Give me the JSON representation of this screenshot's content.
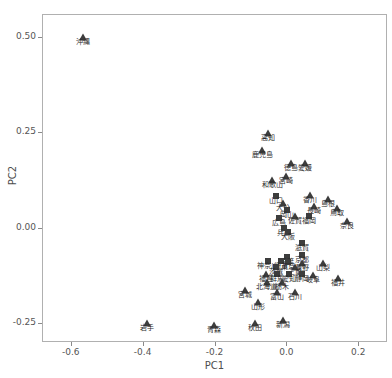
{
  "chart_data": {
    "type": "scatter",
    "title": "",
    "xlabel": "PC1",
    "ylabel": "PC2",
    "xlim": [
      -0.68,
      0.28
    ],
    "ylim": [
      -0.3,
      0.56
    ],
    "grid": false,
    "legend": "none",
    "xticks": [
      "-0.6",
      "-0.4",
      "-0.2",
      "0.0",
      "0.2"
    ],
    "xtick_values": [
      -0.6,
      -0.4,
      -0.2,
      0.0,
      0.2
    ],
    "yticks": [
      "0.50",
      "0.25",
      "0.00",
      "-0.25"
    ],
    "ytick_values": [
      0.5,
      0.25,
      0.0,
      -0.25
    ],
    "point_label_lang": "ja",
    "points": [
      {
        "label": "沖縄",
        "x": -0.57,
        "y": 0.502,
        "marker": "triangle"
      },
      {
        "label": "高知",
        "x": -0.055,
        "y": 0.25,
        "marker": "triangle"
      },
      {
        "label": "鹿児島",
        "x": -0.07,
        "y": 0.205,
        "marker": "triangle"
      },
      {
        "label": "徳島",
        "x": 0.01,
        "y": 0.172,
        "marker": "triangle"
      },
      {
        "label": "愛媛",
        "x": 0.048,
        "y": 0.172,
        "marker": "triangle"
      },
      {
        "label": "和歌山",
        "x": -0.042,
        "y": 0.128,
        "marker": "triangle"
      },
      {
        "label": "宮崎",
        "x": -0.005,
        "y": 0.138,
        "marker": "triangle"
      },
      {
        "label": "山口",
        "x": -0.032,
        "y": 0.085,
        "marker": "square"
      },
      {
        "label": "大分",
        "x": -0.012,
        "y": 0.068,
        "marker": "triangle"
      },
      {
        "label": "岡山",
        "x": 0.0,
        "y": 0.05,
        "marker": "square"
      },
      {
        "label": "香川",
        "x": 0.062,
        "y": 0.088,
        "marker": "triangle"
      },
      {
        "label": "長崎",
        "x": 0.075,
        "y": 0.058,
        "marker": "triangle"
      },
      {
        "label": "島根",
        "x": 0.112,
        "y": 0.078,
        "marker": "triangle"
      },
      {
        "label": "鳥取",
        "x": 0.138,
        "y": 0.055,
        "marker": "triangle"
      },
      {
        "label": "広島",
        "x": -0.022,
        "y": 0.028,
        "marker": "square"
      },
      {
        "label": "佐賀",
        "x": 0.022,
        "y": 0.032,
        "marker": "triangle"
      },
      {
        "label": "福岡",
        "x": 0.06,
        "y": 0.032,
        "marker": "square"
      },
      {
        "label": "奈良",
        "x": 0.165,
        "y": 0.02,
        "marker": "triangle"
      },
      {
        "label": "兵庫",
        "x": -0.01,
        "y": 0.002,
        "marker": "square"
      },
      {
        "label": "大阪",
        "x": 0.002,
        "y": -0.01,
        "marker": "square"
      },
      {
        "label": "滋賀",
        "x": 0.04,
        "y": -0.038,
        "marker": "square"
      },
      {
        "label": "千葉",
        "x": 0.0,
        "y": -0.075,
        "marker": "square"
      },
      {
        "label": "京都",
        "x": 0.04,
        "y": -0.068,
        "marker": "square"
      },
      {
        "label": "神奈川",
        "x": -0.055,
        "y": -0.085,
        "marker": "square"
      },
      {
        "label": "埼玉",
        "x": -0.018,
        "y": -0.085,
        "marker": "square"
      },
      {
        "label": "東京",
        "x": 0.002,
        "y": -0.088,
        "marker": "square"
      },
      {
        "label": "長野",
        "x": 0.04,
        "y": -0.09,
        "marker": "triangle"
      },
      {
        "label": "山梨",
        "x": 0.098,
        "y": -0.09,
        "marker": "triangle"
      },
      {
        "label": "茨城",
        "x": -0.032,
        "y": -0.1,
        "marker": "square"
      },
      {
        "label": "三重",
        "x": 0.022,
        "y": -0.1,
        "marker": "triangle"
      },
      {
        "label": "福島",
        "x": -0.06,
        "y": -0.118,
        "marker": "triangle"
      },
      {
        "label": "群馬",
        "x": -0.03,
        "y": -0.118,
        "marker": "square"
      },
      {
        "label": "愛知",
        "x": 0.005,
        "y": -0.118,
        "marker": "square"
      },
      {
        "label": "静岡",
        "x": 0.042,
        "y": -0.118,
        "marker": "square"
      },
      {
        "label": "岐阜",
        "x": 0.07,
        "y": -0.122,
        "marker": "triangle"
      },
      {
        "label": "福井",
        "x": 0.14,
        "y": -0.13,
        "marker": "triangle"
      },
      {
        "label": "北海道",
        "x": -0.058,
        "y": -0.14,
        "marker": "triangle"
      },
      {
        "label": "栃木",
        "x": -0.015,
        "y": -0.14,
        "marker": "triangle"
      },
      {
        "label": "富山",
        "x": -0.028,
        "y": -0.165,
        "marker": "triangle"
      },
      {
        "label": "石川",
        "x": 0.02,
        "y": -0.165,
        "marker": "triangle"
      },
      {
        "label": "宮城",
        "x": -0.118,
        "y": -0.16,
        "marker": "triangle"
      },
      {
        "label": "山形",
        "x": -0.082,
        "y": -0.192,
        "marker": "triangle"
      },
      {
        "label": "新潟",
        "x": -0.012,
        "y": -0.24,
        "marker": "triangle"
      },
      {
        "label": "秋田",
        "x": -0.09,
        "y": -0.248,
        "marker": "triangle"
      },
      {
        "label": "青森",
        "x": -0.205,
        "y": -0.252,
        "marker": "triangle"
      },
      {
        "label": "岩手",
        "x": -0.392,
        "y": -0.248,
        "marker": "triangle"
      }
    ]
  }
}
